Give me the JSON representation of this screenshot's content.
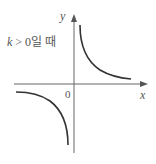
{
  "figure": {
    "condition_label": {
      "var": "k",
      "rest": " > 0일 때"
    },
    "axes": {
      "x_label": "x",
      "y_label": "y",
      "origin_label": "0"
    },
    "colors": {
      "axis": "#666666",
      "curve": "#333333",
      "text": "#555555"
    },
    "curves": [
      {
        "name": "first-quadrant-branch",
        "description": "y = k/x for x > 0"
      },
      {
        "name": "third-quadrant-branch",
        "description": "y = k/x for x < 0"
      }
    ]
  }
}
